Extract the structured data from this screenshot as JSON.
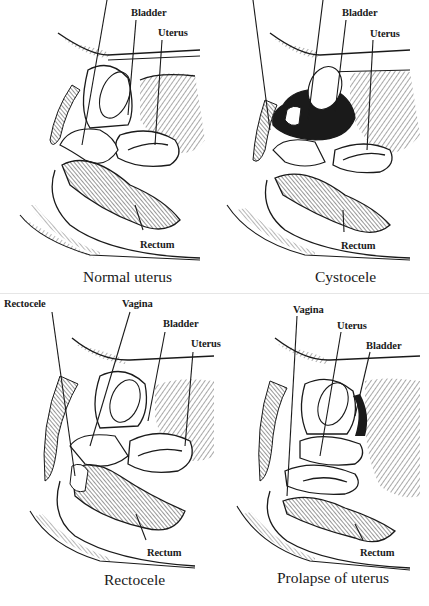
{
  "figure": {
    "background": "#ffffff",
    "ink_color": "#1a1a1a",
    "panels": [
      {
        "id": "normal",
        "caption": "Normal uterus",
        "labels": {
          "bladder": "Bladder",
          "uterus": "Uterus",
          "rectum": "Rectum"
        }
      },
      {
        "id": "cystocele",
        "caption": "Cystocele",
        "labels": {
          "bladder": "Bladder",
          "uterus": "Uterus",
          "rectum": "Rectum"
        }
      },
      {
        "id": "rectocele",
        "caption": "Rectocele",
        "labels": {
          "rectocele": "Rectocele",
          "vagina": "Vagina",
          "bladder": "Bladder",
          "uterus": "Uterus",
          "rectum": "Rectum"
        }
      },
      {
        "id": "prolapse",
        "caption": "Prolapse of uterus",
        "labels": {
          "vagina": "Vagina",
          "uterus": "Uterus",
          "bladder": "Bladder",
          "rectum": "Rectum"
        }
      }
    ]
  }
}
